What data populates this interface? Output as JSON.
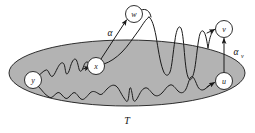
{
  "figure": {
    "caption_region_label": "T",
    "background_color": "#ffffff",
    "ink_color": "#1a1a1a",
    "region": {
      "name": "T",
      "label": "T",
      "shape": "ellipse",
      "fill_color": "#b3b3b3",
      "stroke_color": "#1a1a1a",
      "cx": 127,
      "cy": 73,
      "rx": 118,
      "ry": 33
    },
    "nodes": [
      {
        "id": "y",
        "label": "y",
        "cx": 33,
        "cy": 80,
        "r": 8.5
      },
      {
        "id": "x",
        "label": "x",
        "cx": 96,
        "cy": 66,
        "r": 8.5
      },
      {
        "id": "w",
        "label": "w",
        "cx": 134,
        "cy": 14,
        "r": 8.5
      },
      {
        "id": "v",
        "label": "v",
        "cx": 224,
        "cy": 29,
        "r": 8.5
      },
      {
        "id": "u",
        "label": "u",
        "cx": 224,
        "cy": 81,
        "r": 8.5
      }
    ],
    "edge_labels": [
      {
        "id": "alpha",
        "text": "α",
        "subscript": "",
        "x": 110,
        "y": 33
      },
      {
        "id": "alpha-v",
        "text": "α",
        "subscript": "v",
        "x": 238,
        "y": 52
      }
    ],
    "arrows": [
      {
        "id": "x-to-w",
        "from": "x",
        "to": "w",
        "style": "straight"
      },
      {
        "id": "u-to-v",
        "from": "u",
        "to": "v",
        "style": "straight-vertical"
      },
      {
        "id": "walk-to-v",
        "from": "walk-upper",
        "to": "v",
        "style": "curved"
      },
      {
        "id": "walk-to-x",
        "from": "walk-upper",
        "to": "x",
        "style": "wavy"
      },
      {
        "id": "walk-to-u",
        "from": "walk-lower",
        "to": "u",
        "style": "wavy"
      }
    ],
    "walks": [
      {
        "id": "walk-upper",
        "description": "rough path from y through x oscillating above and below T boundary toward v"
      },
      {
        "id": "walk-lower",
        "description": "rough path from y along lower region of T toward u"
      }
    ]
  }
}
